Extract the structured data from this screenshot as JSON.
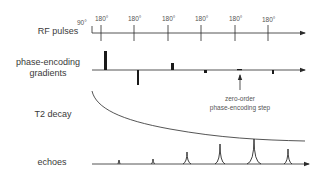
{
  "labels": {
    "rf_pulses": "RF pulses",
    "phase_encoding_line1": "phase-encoding",
    "phase_encoding_line2": "gradients",
    "t2_decay": "T2 decay",
    "echoes": "echoes"
  },
  "rf": {
    "excitation_label": "90°",
    "refocus_labels": [
      "180°",
      "180°",
      "180°",
      "180°",
      "180°",
      "180°"
    ]
  },
  "annotation": {
    "line1": "zero-order",
    "line2": "phase-encoding step"
  },
  "colors": {
    "line": "#2a2a2a",
    "text": "#3a3a3a"
  }
}
